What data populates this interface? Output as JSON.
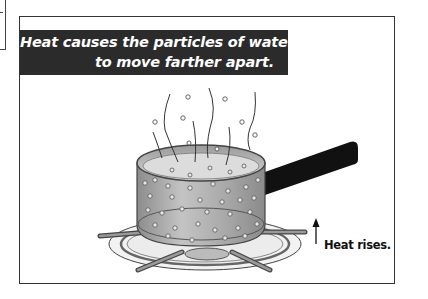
{
  "caption": {
    "line1": "Heat causes the particles of water",
    "line2": "to move farther apart."
  },
  "annotation": {
    "arrow_icon": "up-arrow-icon",
    "label": "Heat rises."
  },
  "illustration": {
    "subject": "pot of boiling water on stove burner",
    "elements": [
      "steam-wisps",
      "water-particles",
      "saucepan",
      "handle",
      "burner-grate",
      "burner-flame-ring"
    ]
  },
  "colors": {
    "caption_bg": "#2b2b2b",
    "caption_text": "#ffffff",
    "frame_border": "#333333",
    "pot_fill": "#a9a9a9",
    "handle": "#111111"
  }
}
